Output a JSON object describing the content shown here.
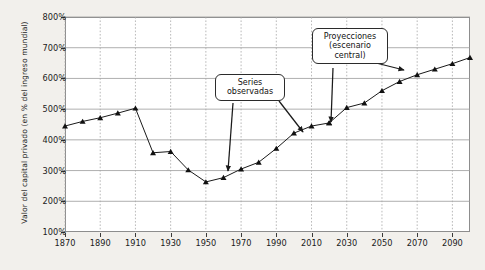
{
  "chart_data": {
    "type": "line",
    "title": "",
    "subtitle": "",
    "xlabel": "",
    "ylabel": "Valor del capital privado (en % del ingreso mundial)",
    "xlim": [
      1870,
      2100
    ],
    "ylim": [
      100,
      800
    ],
    "grid": true,
    "legend_position": "none",
    "y_ticks": [
      "100%",
      "200%",
      "300%",
      "400%",
      "500%",
      "600%",
      "700%",
      "800%"
    ],
    "y_tick_values": [
      100,
      200,
      300,
      400,
      500,
      600,
      700,
      800
    ],
    "x_ticks": [
      "1870",
      "1890",
      "1910",
      "1930",
      "1950",
      "1970",
      "1990",
      "2010",
      "2030",
      "2050",
      "2070",
      "2090"
    ],
    "x_tick_values": [
      1870,
      1890,
      1910,
      1930,
      1950,
      1970,
      1990,
      2010,
      2030,
      2050,
      2070,
      2090
    ],
    "series": [
      {
        "name": "Series observadas",
        "marker": "triangle",
        "x": [
          1870,
          1880,
          1890,
          1900,
          1910,
          1920,
          1930,
          1940,
          1950,
          1960,
          1970,
          1980,
          1990,
          2000,
          2010,
          2020
        ],
        "values": [
          445,
          460,
          472,
          487,
          503,
          358,
          362,
          302,
          263,
          277,
          305,
          327,
          372,
          422,
          445,
          455
        ]
      },
      {
        "name": "Proyecciones (escenario central)",
        "marker": "triangle",
        "x": [
          2020,
          2030,
          2040,
          2050,
          2060,
          2070,
          2080,
          2090,
          2100
        ],
        "values": [
          455,
          505,
          520,
          560,
          590,
          612,
          630,
          648,
          668
        ]
      }
    ],
    "annotations": [
      {
        "name": "observed-callout",
        "text": "Series\nobservadas"
      },
      {
        "name": "projected-callout",
        "text": "Proyecciones\n(escenario\ncentral)"
      }
    ],
    "colors": {
      "line": "#1a1a1a",
      "marker": "#111111",
      "grid": "#9a9a9a",
      "vgrid": "#a8a8a8",
      "plot_background": "#ffffff",
      "page_background": "#f2f0ec",
      "frame": "#8d8d8d",
      "text": "#1b1b1b"
    }
  }
}
